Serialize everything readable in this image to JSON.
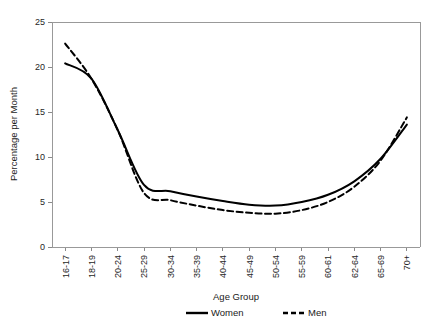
{
  "chart_data": {
    "type": "line",
    "title": "",
    "xlabel": "Age Group",
    "ylabel": "Percentage per Month",
    "categories": [
      "16-17",
      "18-19",
      "20-24",
      "25-29",
      "30-34",
      "35-39",
      "40-44",
      "45-49",
      "50-54",
      "55-59",
      "60-61",
      "62-64",
      "65-69",
      "70+"
    ],
    "series": [
      {
        "name": "Women",
        "style": "solid",
        "values": [
          20.4,
          18.7,
          13.0,
          6.9,
          6.2,
          5.6,
          5.1,
          4.7,
          4.6,
          5.0,
          5.8,
          7.3,
          9.8,
          13.6
        ]
      },
      {
        "name": "Men",
        "style": "dashed",
        "values": [
          22.6,
          18.7,
          13.0,
          6.0,
          5.2,
          4.6,
          4.1,
          3.8,
          3.7,
          4.1,
          5.0,
          6.7,
          9.6,
          14.4
        ]
      }
    ],
    "ylim": [
      0,
      25
    ],
    "yticks": [
      0,
      5,
      10,
      15,
      20,
      25
    ],
    "ytick_labels": [
      "0",
      "5",
      "10",
      "15",
      "20",
      "25"
    ],
    "grid": false,
    "legend_position": "bottom",
    "legend": [
      {
        "label": "Women",
        "style": "solid"
      },
      {
        "label": "Men",
        "style": "dashed"
      }
    ]
  }
}
